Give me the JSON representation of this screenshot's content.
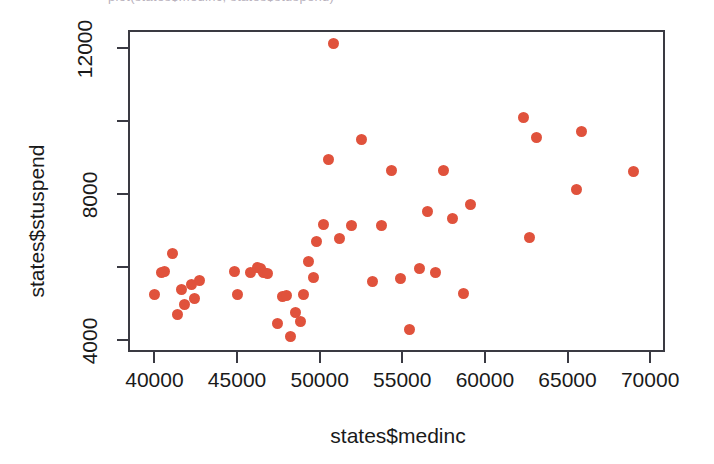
{
  "figure": {
    "top_cut_text": "plot(states$medinc, states$stuspend)",
    "point_color": "#e0523c",
    "axis_color": "#3a3a42",
    "background": "#ffffff"
  },
  "chart_data": {
    "type": "scatter",
    "title": "",
    "xlabel": "states$medinc",
    "ylabel": "states$stuspend",
    "xlim": [
      38400,
      70900
    ],
    "ylim": [
      3670,
      12480
    ],
    "xticks": [
      40000,
      45000,
      50000,
      55000,
      60000,
      65000,
      70000
    ],
    "xtick_labels": [
      "40000",
      "45000",
      "50000",
      "55000",
      "60000",
      "65000",
      "70000"
    ],
    "yticks": [
      4000,
      6000,
      8000,
      10000,
      12000
    ],
    "ytick_labels": [
      "4000",
      "",
      "8000",
      "",
      "12000"
    ],
    "ytick_labels_shown": [
      "4000",
      "8000",
      "12000"
    ],
    "grid": false,
    "legend": false,
    "marker": "filled-circle",
    "n_points": 50,
    "x": [
      39900,
      40300,
      40500,
      41000,
      41300,
      41500,
      41700,
      42100,
      42300,
      42600,
      44700,
      44900,
      45700,
      46100,
      46300,
      46500,
      46700,
      47300,
      47600,
      47900,
      48100,
      48400,
      48700,
      48900,
      49200,
      49500,
      49700,
      50100,
      50400,
      50700,
      51100,
      51800,
      52400,
      53100,
      53600,
      54200,
      54800,
      55300,
      55900,
      56400,
      56900,
      57400,
      57900,
      58600,
      59000,
      62200,
      62600,
      63000,
      65400,
      65700,
      68900
    ],
    "y": [
      5310,
      5900,
      5930,
      6430,
      4760,
      5440,
      5020,
      5570,
      5190,
      5670,
      5930,
      5290,
      5910,
      6030,
      6000,
      5890,
      5860,
      4500,
      5230,
      5280,
      4160,
      4800,
      4560,
      5310,
      6190,
      5750,
      6760,
      7200,
      8980,
      12160,
      6840,
      7180,
      9530,
      5660,
      7190,
      8680,
      5730,
      4330,
      6000,
      7560,
      5910,
      8680,
      7380,
      5320,
      7750,
      10150,
      6870,
      9600,
      8180,
      9760,
      8670
    ]
  }
}
